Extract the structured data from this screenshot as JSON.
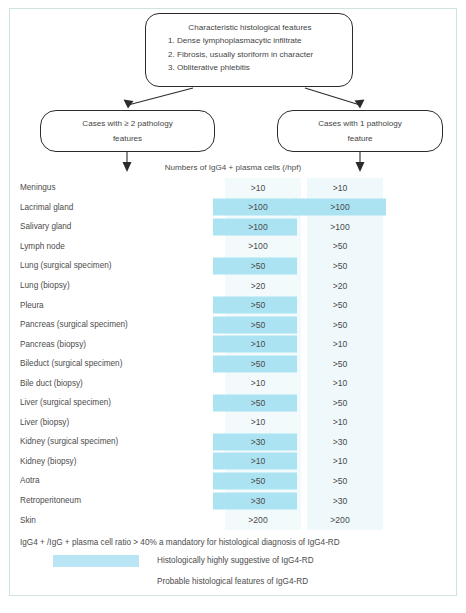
{
  "flowchart": {
    "top_box": {
      "title": "Characteristic histological features",
      "items": [
        "1. Dense lymphoplasmacytic infiltrate",
        "2. Fibrosis, usually storiform in character",
        "3. Obliterative phlebitis"
      ]
    },
    "left_box": {
      "line1": "Cases with ≥ 2 pathology",
      "line2": "features"
    },
    "right_box": {
      "line1": "Cases with 1 pathology",
      "line2": "feature"
    },
    "axis_label": "Numbers of IgG4 + plasma cells (/hpf)"
  },
  "table": {
    "rows": [
      {
        "organ": "Meningus",
        "col1": ">10",
        "col1_hl": false,
        "col2": ">10",
        "col2_hl": false
      },
      {
        "organ": "Lacrimal gland",
        "col1": ">100",
        "col1_hl": true,
        "col2": ">100",
        "col2_hl": true
      },
      {
        "organ": "Salivary gland",
        "col1": ">100",
        "col1_hl": true,
        "col2": ">100",
        "col2_hl": false
      },
      {
        "organ": "Lymph node",
        "col1": ">100",
        "col1_hl": false,
        "col2": ">50",
        "col2_hl": false
      },
      {
        "organ": "Lung (surgical specimen)",
        "col1": ">50",
        "col1_hl": true,
        "col2": ">50",
        "col2_hl": false
      },
      {
        "organ": "Lung (biopsy)",
        "col1": ">20",
        "col1_hl": false,
        "col2": ">20",
        "col2_hl": false
      },
      {
        "organ": "Pleura",
        "col1": ">50",
        "col1_hl": true,
        "col2": ">50",
        "col2_hl": false
      },
      {
        "organ": "Pancreas (surgical specimen)",
        "col1": ">50",
        "col1_hl": true,
        "col2": ">50",
        "col2_hl": false
      },
      {
        "organ": "Pancreas (biopsy)",
        "col1": ">10",
        "col1_hl": true,
        "col2": ">10",
        "col2_hl": false
      },
      {
        "organ": "Bileduct (surgical specimen)",
        "col1": ">50",
        "col1_hl": true,
        "col2": ">50",
        "col2_hl": false
      },
      {
        "organ": "Bile duct (biopsy)",
        "col1": ">10",
        "col1_hl": false,
        "col2": ">10",
        "col2_hl": false
      },
      {
        "organ": "Liver (surgical specimen)",
        "col1": ">50",
        "col1_hl": true,
        "col2": ">50",
        "col2_hl": false
      },
      {
        "organ": "Liver (biopsy)",
        "col1": ">10",
        "col1_hl": false,
        "col2": ">10",
        "col2_hl": false
      },
      {
        "organ": "Kidney (surgical specimen)",
        "col1": ">30",
        "col1_hl": true,
        "col2": ">30",
        "col2_hl": false
      },
      {
        "organ": "Kidney (biopsy)",
        "col1": ">10",
        "col1_hl": true,
        "col2": ">10",
        "col2_hl": false
      },
      {
        "organ": "Aotra",
        "col1": ">50",
        "col1_hl": true,
        "col2": ">50",
        "col2_hl": false
      },
      {
        "organ": "Retroperitoneum",
        "col1": ">30",
        "col1_hl": true,
        "col2": ">30",
        "col2_hl": false
      },
      {
        "organ": "Skin",
        "col1": ">200",
        "col1_hl": false,
        "col2": ">200",
        "col2_hl": false
      }
    ]
  },
  "footer": {
    "note": "IgG4 + /IgG + plasma cell ratio > 40% a mandatory for histological diagnosis of IgG4-RD",
    "legend": [
      {
        "label": "Histologically highly suggestive of IgG4-RD",
        "swatch": "blue"
      },
      {
        "label": "Probable histological features of IgG4-RD",
        "swatch": "white"
      }
    ]
  },
  "colors": {
    "highlight": "#ace3f2",
    "legend_swatch": "#b9e5f4",
    "frame": "#cfe4e2",
    "text": "#4c4c4c",
    "box_border": "#2b2b2b"
  }
}
